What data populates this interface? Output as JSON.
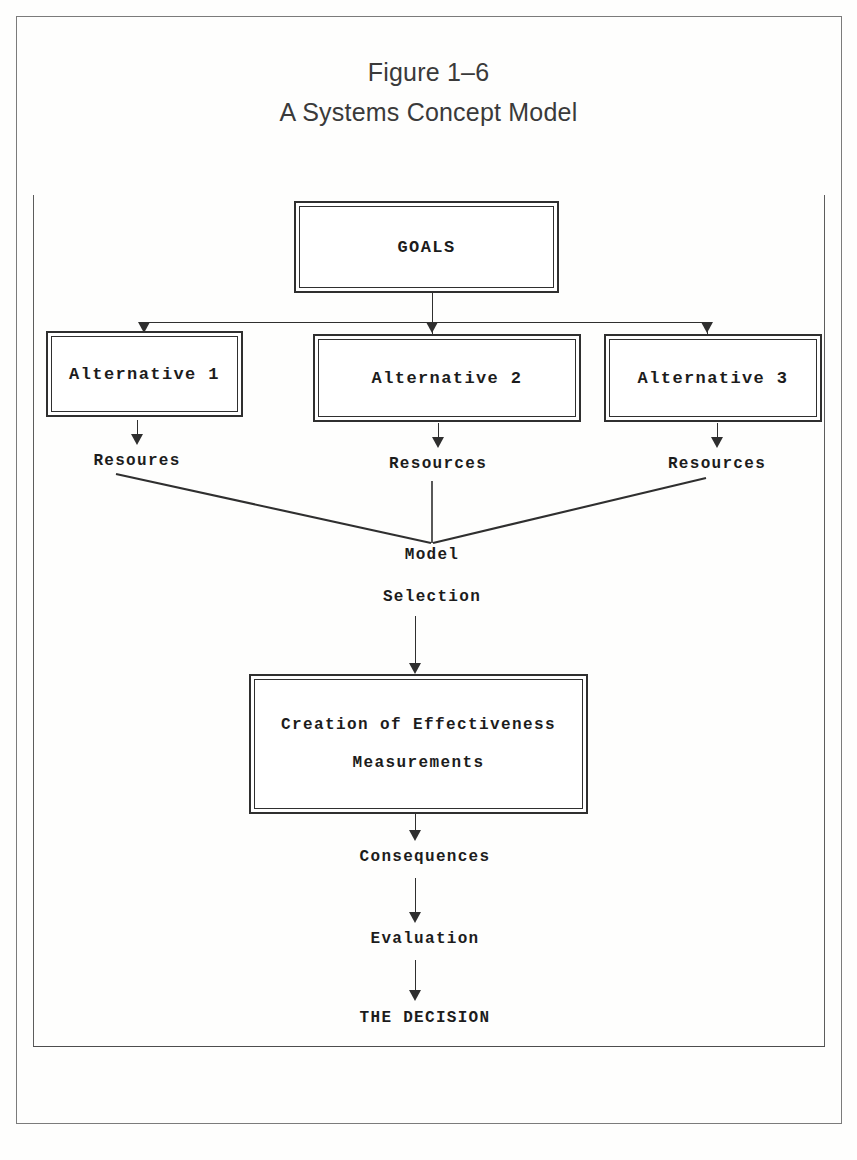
{
  "figure": {
    "caption_line1": "Figure 1–6",
    "caption_line2": "A Systems Concept Model"
  },
  "diagram": {
    "type": "flowchart",
    "goal_box": {
      "label": "GOALS"
    },
    "alternatives": [
      {
        "label": "Alternative 1",
        "resource_label": "Resoures"
      },
      {
        "label": "Alternative 2",
        "resource_label": "Resources"
      },
      {
        "label": "Alternative 3",
        "resource_label": "Resources"
      }
    ],
    "model_selection": {
      "line1": "Model",
      "line2": "Selection"
    },
    "effectiveness_box": {
      "line1": "Creation of Effectiveness",
      "line2": "Measurements"
    },
    "outcomes": [
      {
        "label": "Consequences"
      },
      {
        "label": "Evaluation"
      },
      {
        "label": "THE DECISION"
      }
    ]
  },
  "colors": {
    "ink": "#1c1c1c",
    "rule": "#2f2f2f",
    "paper": "#fefefd",
    "caption": "#3a3a3a"
  }
}
